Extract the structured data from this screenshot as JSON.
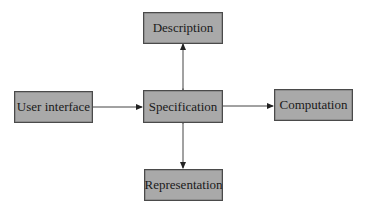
{
  "diagram": {
    "nodes": [
      {
        "id": "description",
        "label": "Description"
      },
      {
        "id": "user_interface",
        "label": "User interface"
      },
      {
        "id": "specification",
        "label": "Specification"
      },
      {
        "id": "computation",
        "label": "Computation"
      },
      {
        "id": "representation",
        "label": "Representation"
      }
    ],
    "edges": [
      {
        "from": "user_interface",
        "to": "specification",
        "direction": "one-way"
      },
      {
        "from": "specification",
        "to": "computation",
        "direction": "one-way"
      },
      {
        "from": "specification",
        "to": "description",
        "direction": "bidirectional"
      },
      {
        "from": "specification",
        "to": "representation",
        "direction": "bidirectional"
      }
    ],
    "colors": {
      "box_fill": "#a9a9a9",
      "box_border": "#4a4a4a",
      "line": "#333333"
    }
  }
}
